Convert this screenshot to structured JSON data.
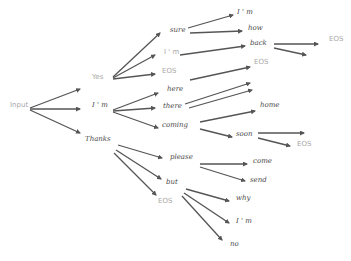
{
  "diagram": {
    "type": "beam-search-tree",
    "colors": {
      "arrow": "#555555",
      "text_dark": "#4a4a4a",
      "text_light": "#a8a8a8",
      "background": "#ffffff"
    },
    "nodes": [
      {
        "id": "input",
        "label": "Input",
        "x": 10,
        "y": 106,
        "tone": "light"
      },
      {
        "id": "yes",
        "label": "Yes",
        "x": 92,
        "y": 78,
        "tone": "light"
      },
      {
        "id": "im1",
        "label": "I ' m",
        "x": 92,
        "y": 106,
        "tone": "dark"
      },
      {
        "id": "thanks",
        "label": "Thanks",
        "x": 85,
        "y": 140,
        "tone": "dark"
      },
      {
        "id": "sure",
        "label": "sure",
        "x": 170,
        "y": 31,
        "tone": "dark"
      },
      {
        "id": "im2",
        "label": "I ' m",
        "x": 164,
        "y": 53,
        "tone": "light"
      },
      {
        "id": "eos1",
        "label": "EOS",
        "x": 162,
        "y": 72,
        "tone": "light"
      },
      {
        "id": "here",
        "label": "here",
        "x": 167,
        "y": 90,
        "tone": "dark"
      },
      {
        "id": "there",
        "label": "there",
        "x": 163,
        "y": 107,
        "tone": "dark"
      },
      {
        "id": "coming",
        "label": "coming",
        "x": 162,
        "y": 126,
        "tone": "dark"
      },
      {
        "id": "im3",
        "label": "I ' m",
        "x": 237,
        "y": 13,
        "tone": "dark"
      },
      {
        "id": "how",
        "label": "how",
        "x": 248,
        "y": 29,
        "tone": "dark"
      },
      {
        "id": "back",
        "label": "back",
        "x": 250,
        "y": 44,
        "tone": "dark"
      },
      {
        "id": "eos2",
        "label": "EOS",
        "x": 254,
        "y": 63,
        "tone": "light"
      },
      {
        "id": "home",
        "label": "home",
        "x": 260,
        "y": 106,
        "tone": "dark"
      },
      {
        "id": "soon",
        "label": "soon",
        "x": 236,
        "y": 135,
        "tone": "dark"
      },
      {
        "id": "eos3",
        "label": "EOS",
        "x": 329,
        "y": 40,
        "tone": "light"
      },
      {
        "id": "eos4",
        "label": "EOS",
        "x": 297,
        "y": 145,
        "tone": "light"
      },
      {
        "id": "please",
        "label": "please",
        "x": 170,
        "y": 158,
        "tone": "dark"
      },
      {
        "id": "but",
        "label": "but",
        "x": 166,
        "y": 183,
        "tone": "dark"
      },
      {
        "id": "eos5",
        "label": "EOS",
        "x": 158,
        "y": 202,
        "tone": "light"
      },
      {
        "id": "come",
        "label": "come",
        "x": 253,
        "y": 162,
        "tone": "dark"
      },
      {
        "id": "send",
        "label": "send",
        "x": 250,
        "y": 181,
        "tone": "dark"
      },
      {
        "id": "why",
        "label": "why",
        "x": 236,
        "y": 199,
        "tone": "dark"
      },
      {
        "id": "im4",
        "label": "I ' m",
        "x": 236,
        "y": 222,
        "tone": "dark"
      },
      {
        "id": "no",
        "label": "no",
        "x": 230,
        "y": 245,
        "tone": "dark"
      }
    ],
    "edges": [
      [
        30,
        108,
        80,
        89
      ],
      [
        30,
        109,
        80,
        109
      ],
      [
        30,
        110,
        80,
        133
      ],
      [
        113,
        77,
        160,
        33
      ],
      [
        113,
        78,
        155,
        55
      ],
      [
        113,
        79,
        155,
        74
      ],
      [
        113,
        110,
        158,
        93
      ],
      [
        113,
        111,
        155,
        108
      ],
      [
        113,
        112,
        158,
        128
      ],
      [
        188,
        28,
        233,
        15
      ],
      [
        190,
        33,
        242,
        31
      ],
      [
        180,
        55,
        245,
        46
      ],
      [
        190,
        80,
        250,
        67
      ],
      [
        185,
        104,
        250,
        83
      ],
      [
        189,
        108,
        252,
        90
      ],
      [
        200,
        122,
        255,
        111
      ],
      [
        200,
        129,
        232,
        137
      ],
      [
        274,
        44,
        318,
        44
      ],
      [
        274,
        48,
        306,
        55
      ],
      [
        258,
        133,
        304,
        133
      ],
      [
        258,
        138,
        290,
        146
      ],
      [
        118,
        145,
        162,
        158
      ],
      [
        116,
        150,
        161,
        179
      ],
      [
        114,
        153,
        156,
        195
      ],
      [
        200,
        164,
        247,
        164
      ],
      [
        200,
        167,
        245,
        181
      ],
      [
        186,
        189,
        229,
        201
      ],
      [
        184,
        193,
        229,
        223
      ],
      [
        182,
        196,
        222,
        240
      ]
    ]
  }
}
